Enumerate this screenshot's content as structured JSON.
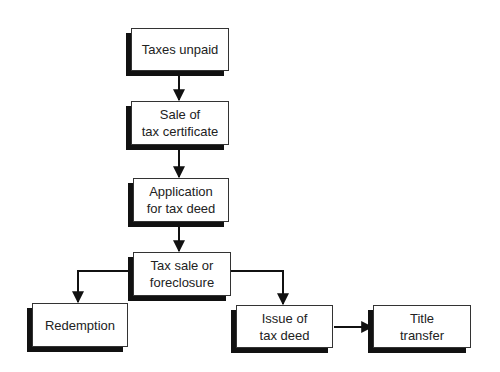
{
  "diagram": {
    "type": "flowchart",
    "nodes": [
      {
        "id": "taxes_unpaid",
        "label": "Taxes unpaid"
      },
      {
        "id": "sale_certificate",
        "label": "Sale of\ntax certificate"
      },
      {
        "id": "application",
        "label": "Application\nfor tax deed"
      },
      {
        "id": "tax_sale",
        "label": "Tax sale or\nforeclosure"
      },
      {
        "id": "redemption",
        "label": "Redemption"
      },
      {
        "id": "issue_deed",
        "label": "Issue of\ntax deed"
      },
      {
        "id": "title_transfer",
        "label": "Title\ntransfer"
      }
    ],
    "edges": [
      {
        "from": "taxes_unpaid",
        "to": "sale_certificate"
      },
      {
        "from": "sale_certificate",
        "to": "application"
      },
      {
        "from": "application",
        "to": "tax_sale"
      },
      {
        "from": "tax_sale",
        "to": "redemption"
      },
      {
        "from": "tax_sale",
        "to": "issue_deed"
      },
      {
        "from": "issue_deed",
        "to": "title_transfer"
      }
    ],
    "colors": {
      "line": "#111111",
      "box_fill": "#ffffff",
      "shadow": "#111111"
    }
  }
}
